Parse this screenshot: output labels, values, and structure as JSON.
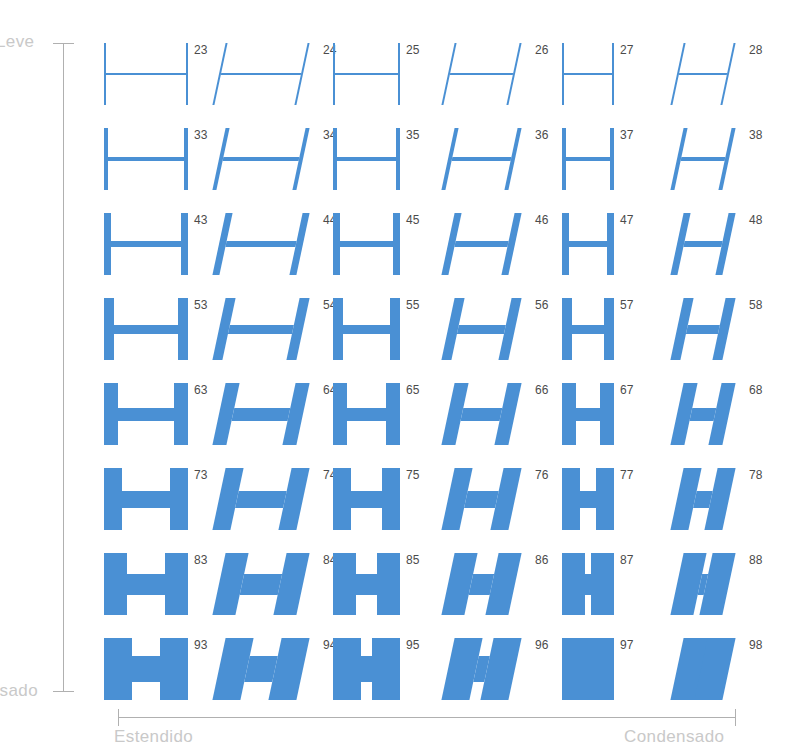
{
  "axes": {
    "vertical": {
      "top_label": "Leve",
      "bottom_label": "Pesado"
    },
    "horizontal": {
      "left_label": "Estendido",
      "right_label": "Condensado"
    }
  },
  "colors": {
    "glyph": "#4a90d4",
    "axis": "#b0b0b0",
    "axis_label": "#c9c9c9",
    "number": "#4b4b4b",
    "background": "#ffffff"
  },
  "chart_data": {
    "type": "table",
    "title": "",
    "xlabel": "Estendido → Condensado",
    "ylabel": "Leve → Pesado",
    "glyph": "H",
    "row_labels": [
      "23",
      "33",
      "43",
      "53",
      "63",
      "73",
      "83",
      "93"
    ],
    "column_styles": [
      "roman",
      "italic",
      "roman",
      "italic",
      "roman",
      "italic"
    ],
    "column_widths": [
      "extended",
      "extended",
      "regular",
      "regular",
      "condensed",
      "condensed"
    ],
    "cells": [
      [
        {
          "number": "23",
          "weight": 2,
          "width": 1.0,
          "italic": false
        },
        {
          "number": "24",
          "weight": 2,
          "width": 1.0,
          "italic": true
        },
        {
          "number": "25",
          "weight": 2,
          "width": 0.8,
          "italic": false
        },
        {
          "number": "26",
          "weight": 2,
          "width": 0.8,
          "italic": true
        },
        {
          "number": "27",
          "weight": 2,
          "width": 0.62,
          "italic": false
        },
        {
          "number": "28",
          "weight": 2,
          "width": 0.62,
          "italic": true
        }
      ],
      [
        {
          "number": "33",
          "weight": 4,
          "width": 1.0,
          "italic": false
        },
        {
          "number": "34",
          "weight": 4,
          "width": 1.0,
          "italic": true
        },
        {
          "number": "35",
          "weight": 4,
          "width": 0.8,
          "italic": false
        },
        {
          "number": "36",
          "weight": 4,
          "width": 0.8,
          "italic": true
        },
        {
          "number": "37",
          "weight": 4,
          "width": 0.62,
          "italic": false
        },
        {
          "number": "38",
          "weight": 4,
          "width": 0.62,
          "italic": true
        }
      ],
      [
        {
          "number": "43",
          "weight": 7,
          "width": 1.0,
          "italic": false
        },
        {
          "number": "44",
          "weight": 7,
          "width": 1.0,
          "italic": true
        },
        {
          "number": "45",
          "weight": 7,
          "width": 0.8,
          "italic": false
        },
        {
          "number": "46",
          "weight": 7,
          "width": 0.8,
          "italic": true
        },
        {
          "number": "47",
          "weight": 7,
          "width": 0.62,
          "italic": false
        },
        {
          "number": "48",
          "weight": 7,
          "width": 0.62,
          "italic": true
        }
      ],
      [
        {
          "number": "53",
          "weight": 10,
          "width": 1.0,
          "italic": false
        },
        {
          "number": "54",
          "weight": 10,
          "width": 1.0,
          "italic": true
        },
        {
          "number": "55",
          "weight": 10,
          "width": 0.8,
          "italic": false
        },
        {
          "number": "56",
          "weight": 10,
          "width": 0.8,
          "italic": true
        },
        {
          "number": "57",
          "weight": 10,
          "width": 0.62,
          "italic": false
        },
        {
          "number": "58",
          "weight": 10,
          "width": 0.62,
          "italic": true
        }
      ],
      [
        {
          "number": "63",
          "weight": 14,
          "width": 1.0,
          "italic": false
        },
        {
          "number": "64",
          "weight": 14,
          "width": 1.0,
          "italic": true
        },
        {
          "number": "65",
          "weight": 14,
          "width": 0.8,
          "italic": false
        },
        {
          "number": "66",
          "weight": 14,
          "width": 0.8,
          "italic": true
        },
        {
          "number": "67",
          "weight": 14,
          "width": 0.62,
          "italic": false
        },
        {
          "number": "68",
          "weight": 14,
          "width": 0.62,
          "italic": true
        }
      ],
      [
        {
          "number": "73",
          "weight": 18,
          "width": 1.0,
          "italic": false
        },
        {
          "number": "74",
          "weight": 18,
          "width": 1.0,
          "italic": true
        },
        {
          "number": "75",
          "weight": 18,
          "width": 0.8,
          "italic": false
        },
        {
          "number": "76",
          "weight": 18,
          "width": 0.8,
          "italic": true
        },
        {
          "number": "77",
          "weight": 18,
          "width": 0.62,
          "italic": false
        },
        {
          "number": "78",
          "weight": 18,
          "width": 0.62,
          "italic": true
        }
      ],
      [
        {
          "number": "83",
          "weight": 23,
          "width": 1.0,
          "italic": false
        },
        {
          "number": "84",
          "weight": 23,
          "width": 1.0,
          "italic": true
        },
        {
          "number": "85",
          "weight": 23,
          "width": 0.8,
          "italic": false
        },
        {
          "number": "86",
          "weight": 23,
          "width": 0.8,
          "italic": true
        },
        {
          "number": "87",
          "weight": 23,
          "width": 0.62,
          "italic": false
        },
        {
          "number": "88",
          "weight": 23,
          "width": 0.62,
          "italic": true
        }
      ],
      [
        {
          "number": "93",
          "weight": 28,
          "width": 1.0,
          "italic": false
        },
        {
          "number": "94",
          "weight": 28,
          "width": 1.0,
          "italic": true
        },
        {
          "number": "95",
          "weight": 28,
          "width": 0.8,
          "italic": false
        },
        {
          "number": "96",
          "weight": 28,
          "width": 0.8,
          "italic": true
        },
        {
          "number": "97",
          "weight": 28,
          "width": 0.62,
          "italic": false
        },
        {
          "number": "98",
          "weight": 28,
          "width": 0.62,
          "italic": true
        }
      ]
    ]
  },
  "layout": {
    "column_x": [
      0,
      115,
      229,
      344,
      458,
      573
    ],
    "column_box_width": 84,
    "row_y": [
      0,
      85,
      170,
      255,
      340,
      425,
      510,
      595
    ],
    "glyph_height": 62,
    "italic_slant_px": 14
  }
}
